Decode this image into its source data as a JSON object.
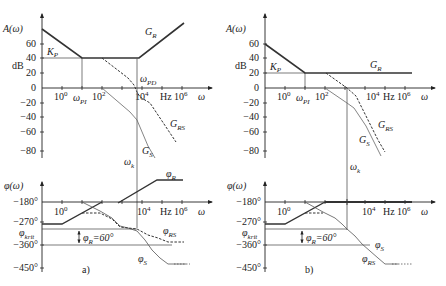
{
  "figure": {
    "panels": [
      {
        "id": "a",
        "label": "a)",
        "magnitude": {
          "y_axis_label": "A(ω)",
          "unit": "dB",
          "y_ticks": [
            "60",
            "40",
            "20",
            "0",
            "−20",
            "−40",
            "−60",
            "−80"
          ],
          "x_ticks": [
            "10",
            "10",
            "10",
            "10"
          ],
          "x_tick_exps": [
            "0",
            "2",
            "4",
            "6"
          ],
          "hz": "Hz",
          "x_axis_label": "ω",
          "kp": "K",
          "kp_sub": "P",
          "omega_pi": "ω",
          "omega_pi_sub": "PI",
          "omega_pd": "ω",
          "omega_pd_sub": "PD",
          "curves": [
            {
              "name": "G",
              "sub": "R",
              "style": "solid-bold"
            },
            {
              "name": "G",
              "sub": "RS",
              "style": "dashed"
            },
            {
              "name": "G",
              "sub": "S",
              "style": "thin"
            }
          ]
        },
        "phase": {
          "y_axis_label": "φ(ω)",
          "y_ticks": [
            "−180°",
            "−270°",
            "−360°",
            "−450°"
          ],
          "phi_krit": "φ",
          "phi_krit_sub": "krit",
          "phase_margin": "φ",
          "phase_margin_sub": "R",
          "phase_margin_val": "=60°",
          "omega_k": "ω",
          "omega_k_sub": "k",
          "curves": [
            {
              "name": "φ",
              "sub": "R"
            },
            {
              "name": "φ",
              "sub": "RS"
            },
            {
              "name": "φ",
              "sub": "S"
            }
          ]
        }
      },
      {
        "id": "b",
        "label": "b)",
        "magnitude": {
          "y_axis_label": "A(ω)",
          "unit": "dB",
          "y_ticks": [
            "60",
            "40",
            "20",
            "0",
            "−20",
            "−40",
            "−60",
            "−80"
          ],
          "x_ticks": [
            "10",
            "10",
            "10",
            "10"
          ],
          "x_tick_exps": [
            "0",
            "2",
            "4",
            "6"
          ],
          "hz": "Hz",
          "x_axis_label": "ω",
          "kp": "K",
          "kp_sub": "P",
          "omega_pi": "ω",
          "omega_pi_sub": "PI",
          "curves": [
            {
              "name": "G",
              "sub": "R"
            },
            {
              "name": "G",
              "sub": "RS"
            },
            {
              "name": "G",
              "sub": "S"
            }
          ]
        },
        "phase": {
          "y_axis_label": "φ(ω)",
          "y_ticks": [
            "−180°",
            "−270°",
            "−360°",
            "−450°"
          ],
          "phi_krit": "φ",
          "phi_krit_sub": "krit",
          "phase_margin": "φ",
          "phase_margin_sub": "R",
          "phase_margin_val": "=60°",
          "omega_k": "ω",
          "omega_k_sub": "k",
          "curves": [
            {
              "name": "φ",
              "sub": "S"
            },
            {
              "name": "φ",
              "sub": "RS"
            }
          ]
        }
      }
    ]
  }
}
